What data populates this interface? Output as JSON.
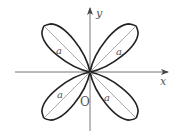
{
  "diagram": {
    "type": "four-leaf rose curve",
    "axes": {
      "x_label": "x",
      "y_label": "y",
      "origin_label": "O"
    },
    "petal_label": "a",
    "petals": [
      {
        "id": "upper-left",
        "label": "a"
      },
      {
        "id": "upper-right",
        "label": "a"
      },
      {
        "id": "lower-left",
        "label": "a"
      },
      {
        "id": "lower-right",
        "label": "a"
      }
    ],
    "colors": {
      "curve": "#222222",
      "axis": "#555555",
      "diameter": "#777777",
      "background": "#ffffff"
    }
  }
}
